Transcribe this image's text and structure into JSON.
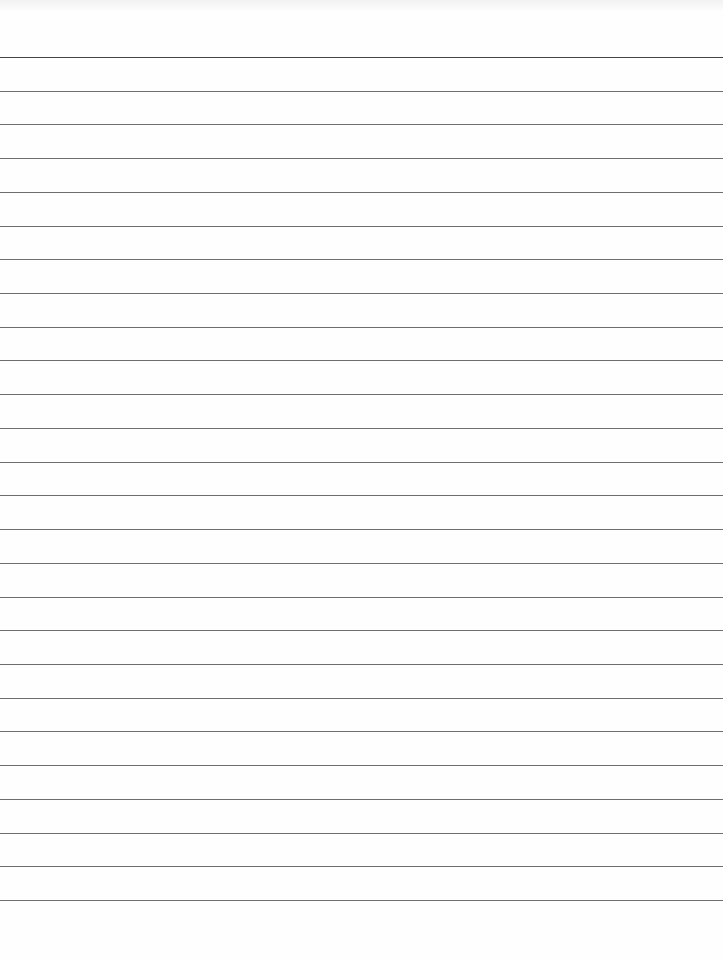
{
  "page": {
    "type": "ruled notebook paper",
    "background_color": "#fefefe",
    "rule_color": "#6e6e6e",
    "rule_count": 26,
    "first_rule_y": 57,
    "rule_spacing_px": 33.72,
    "text_content": []
  }
}
